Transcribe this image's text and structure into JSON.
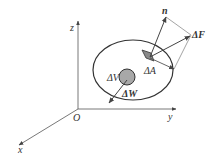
{
  "diagram": {
    "type": "physics-vector-diagram",
    "axes": {
      "origin_label": "O",
      "x_label": "x",
      "y_label": "y",
      "z_label": "z"
    },
    "body": {
      "shape": "ellipse"
    },
    "volume_element": {
      "label": "ΔV",
      "fill": "#a8a8a8",
      "force_label": "ΔW"
    },
    "surface_element": {
      "label": "ΔA",
      "fill": "#8a8a8a",
      "normal_label": "n",
      "force_label": "ΔF"
    },
    "colors": {
      "line": "#444444",
      "background": "#ffffff"
    }
  }
}
